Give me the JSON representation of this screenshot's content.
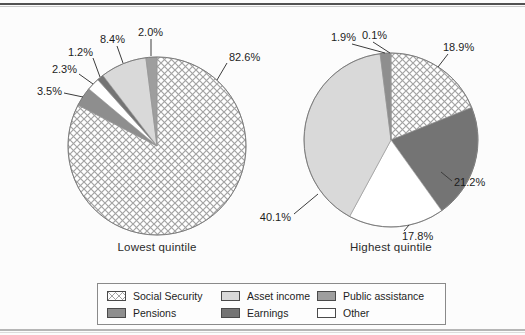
{
  "figure": {
    "background": "#fcfcfc"
  },
  "legend": {
    "items": [
      {
        "id": "social-security",
        "label": "Social Security",
        "fill": "crosshatch"
      },
      {
        "id": "asset-income",
        "label": "Asset income",
        "fill": "#d9d9d9"
      },
      {
        "id": "public-assistance",
        "label": "Public assistance",
        "fill": "#9e9e9e"
      },
      {
        "id": "pensions",
        "label": "Pensions",
        "fill": "#8e8e8e"
      },
      {
        "id": "earnings",
        "label": "Earnings",
        "fill": "#747474"
      },
      {
        "id": "other",
        "label": "Other",
        "fill": "#ffffff"
      }
    ]
  },
  "chart_data": [
    {
      "type": "pie",
      "title": "Lowest quintile",
      "start_angle_deg": 0,
      "direction": "clockwise",
      "legend_position": "bottom",
      "slices": [
        {
          "category": "Social Security",
          "value": 82.6,
          "display": "82.6%",
          "fill": "crosshatch",
          "label": {
            "x": 229,
            "y": 61,
            "anchor": "start",
            "line": [
              227,
              63,
              217,
              80
            ]
          }
        },
        {
          "category": "Pensions",
          "value": 3.5,
          "display": "3.5%",
          "fill": "#8e8e8e",
          "label": {
            "x": 62,
            "y": 95,
            "anchor": "end",
            "line": [
              64,
              93,
              83,
              97
            ]
          }
        },
        {
          "category": "Other",
          "value": 2.3,
          "display": "2.3%",
          "fill": "#ffffff",
          "label": {
            "x": 77,
            "y": 73,
            "anchor": "end",
            "line": [
              79,
              74,
              93,
              84
            ]
          }
        },
        {
          "category": "Earnings",
          "value": 1.2,
          "display": "1.2%",
          "fill": "#747474",
          "label": {
            "x": 93,
            "y": 56,
            "anchor": "end",
            "line": [
              93,
              58,
              100,
              77
            ]
          }
        },
        {
          "category": "Asset income",
          "value": 8.4,
          "display": "8.4%",
          "fill": "#d9d9d9",
          "label": {
            "x": 125,
            "y": 43,
            "anchor": "end",
            "line": [
              117,
              46,
              123,
              63
            ]
          }
        },
        {
          "category": "Public assistance",
          "value": 2.0,
          "display": "2.0%",
          "fill": "#9e9e9e",
          "label": {
            "x": 138,
            "y": 36,
            "anchor": "start",
            "line": [
              151,
              39,
              151,
              56
            ]
          }
        }
      ]
    },
    {
      "type": "pie",
      "title": "Highest quintile",
      "start_angle_deg": 0,
      "direction": "clockwise",
      "legend_position": "bottom",
      "slices": [
        {
          "category": "Social Security",
          "value": 18.9,
          "display": "18.9%",
          "fill": "crosshatch",
          "label": {
            "x": 443,
            "y": 51,
            "anchor": "start",
            "line": [
              448,
              54,
              438,
              67
            ]
          }
        },
        {
          "category": "Earnings",
          "value": 21.2,
          "display": "21.2%",
          "fill": "#747474",
          "label": {
            "x": 454,
            "y": 186,
            "anchor": "start",
            "line": [
              452,
              181,
              441,
              172
            ]
          }
        },
        {
          "category": "Other",
          "value": 17.8,
          "display": "17.8%",
          "fill": "#ffffff",
          "label": {
            "x": 402,
            "y": 240,
            "anchor": "start",
            "line": [
              404,
              231,
              409,
              225
            ]
          }
        },
        {
          "category": "Asset income",
          "value": 40.1,
          "display": "40.1%",
          "fill": "#d9d9d9",
          "label": {
            "x": 291,
            "y": 221,
            "anchor": "end",
            "line": [
              294,
              214,
              318,
              194
            ]
          }
        },
        {
          "category": "Pensions",
          "value": 1.9,
          "display": "1.9%",
          "fill": "#8e8e8e",
          "label": {
            "x": 356,
            "y": 41,
            "anchor": "end",
            "line": [
              352,
              44,
              385,
              53
            ]
          }
        },
        {
          "category": "Public assistance",
          "value": 0.1,
          "display": "0.1%",
          "fill": "#9e9e9e",
          "label": {
            "x": 362,
            "y": 39,
            "anchor": "start",
            "line": [
              373,
              42,
              390,
              53
            ]
          }
        }
      ]
    }
  ]
}
